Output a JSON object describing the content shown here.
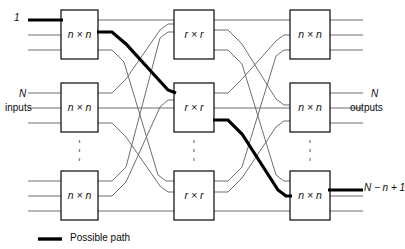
{
  "diagram": {
    "colors": {
      "wire": "#6e6e6e",
      "box_stroke": "#1a1a1a",
      "path": "#000000",
      "text": "#0b0b0b",
      "background": "#ffffff"
    },
    "stages": [
      {
        "name": "input-stage",
        "box_label": "n × n",
        "boxes": [
          {
            "row": "top",
            "label": "n × n"
          },
          {
            "row": "middle",
            "label": "n × n"
          },
          {
            "row": "bottom",
            "label": "n × n"
          }
        ]
      },
      {
        "name": "middle-stage",
        "box_label": "r × r",
        "boxes": [
          {
            "row": "top",
            "label": "r × r"
          },
          {
            "row": "middle",
            "label": "r × r"
          },
          {
            "row": "bottom",
            "label": "r × r"
          }
        ]
      },
      {
        "name": "output-stage",
        "box_label": "n × n",
        "boxes": [
          {
            "row": "top",
            "label": "n × n"
          },
          {
            "row": "middle",
            "label": "n × n"
          },
          {
            "row": "bottom",
            "label": "n × n"
          }
        ]
      }
    ],
    "annotations": {
      "first_input": "1",
      "inputs_line1": "N",
      "inputs_line2": "inputs",
      "outputs_line1": "N",
      "outputs_line2": "outputs",
      "highlighted_output": "N − n + 1"
    },
    "legend": {
      "items": [
        {
          "name": "possible-path",
          "label": "Possible path",
          "color": "#000000",
          "width": 3
        }
      ]
    },
    "ellipsis": {
      "symbol": "vertical-dots",
      "count": 3,
      "note": "vertical dotted ellipsis between middle and bottom rows"
    }
  }
}
